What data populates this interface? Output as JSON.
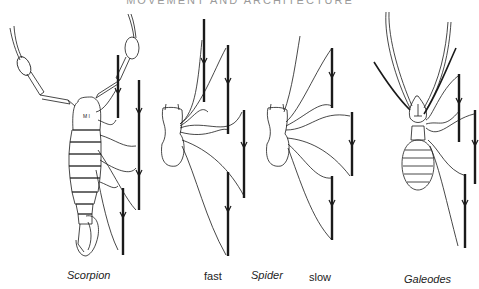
{
  "running_head": "MOVEMENT AND ARCHITECTURE",
  "figure": {
    "panels": [
      {
        "id": "scorpion",
        "caption": "Scorpion",
        "italic": true
      },
      {
        "id": "spider-fast",
        "caption": "fast",
        "italic": false
      },
      {
        "id": "spider-label",
        "caption": "Spider",
        "italic": true
      },
      {
        "id": "spider-slow",
        "caption": "slow",
        "italic": false
      },
      {
        "id": "galeodes",
        "caption": "Galeodes",
        "italic": true
      }
    ],
    "colors": {
      "ink": "#1a1a1a",
      "paper": "#ffffff"
    }
  }
}
